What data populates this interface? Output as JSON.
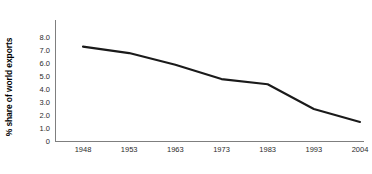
{
  "chart_data": {
    "type": "line",
    "title": "",
    "subtitle": "",
    "xlabel": "",
    "ylabel": "% share of world exports",
    "categories": [
      "1948",
      "1953",
      "1963",
      "1973",
      "1983",
      "1993",
      "2004"
    ],
    "x": [
      "1948",
      "1953",
      "1963",
      "1973",
      "1983",
      "1993",
      "2004"
    ],
    "values": [
      7.3,
      6.8,
      5.9,
      4.8,
      4.4,
      2.5,
      1.5
    ],
    "series": [
      {
        "name": "% share of world exports",
        "values": [
          7.3,
          6.8,
          5.9,
          4.8,
          4.4,
          2.5,
          1.5
        ]
      }
    ],
    "ylim": [
      0,
      8
    ],
    "ytick_values": [
      0,
      1,
      2,
      3,
      4,
      5,
      6,
      7,
      8
    ],
    "ytick_labels": [
      "0",
      "1.0",
      "2.0",
      "3.0",
      "4.0",
      "5.0",
      "6.0",
      "7.0",
      "8.0"
    ],
    "xtick_labels": [
      "1948",
      "1953",
      "1963",
      "1973",
      "1983",
      "1993",
      "2004"
    ],
    "grid": false,
    "legend": false,
    "legend_position": "none",
    "annotations": [],
    "line_color": "#1a1a1a",
    "axis_color": "#7f7f7f",
    "background_color": "#ffffff",
    "line_width": 2.1
  }
}
